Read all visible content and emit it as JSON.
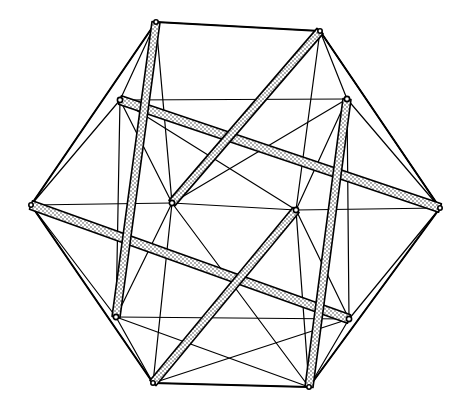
{
  "figure": {
    "canvas": {
      "width": 474,
      "height": 410,
      "background": "#ffffff"
    },
    "colors": {
      "line": "#000000",
      "background": "#ffffff",
      "strut_fill": "#ffffff",
      "stipple": "#1a1a1a"
    },
    "outer_vertices": [
      {
        "name": "top-left",
        "x": 156,
        "y": 22
      },
      {
        "name": "top-right",
        "x": 320,
        "y": 31
      },
      {
        "name": "right",
        "x": 440,
        "y": 208
      },
      {
        "name": "bottom-right",
        "x": 309,
        "y": 387
      },
      {
        "name": "bottom-left",
        "x": 153,
        "y": 383
      },
      {
        "name": "left",
        "x": 31,
        "y": 205
      }
    ],
    "inner_vertices": [
      {
        "name": "upper-left-node",
        "x": 120,
        "y": 100
      },
      {
        "name": "upper-right-node",
        "x": 347,
        "y": 99
      },
      {
        "name": "mid-left-node",
        "x": 172,
        "y": 203
      },
      {
        "name": "mid-right-node",
        "x": 296,
        "y": 210
      },
      {
        "name": "lower-left-node",
        "x": 116,
        "y": 317
      },
      {
        "name": "lower-right-node",
        "x": 349,
        "y": 319
      }
    ],
    "struts": [
      {
        "name": "strut-upper-diagonal",
        "x1": 120,
        "y1": 100,
        "x2": 440,
        "y2": 208,
        "width": 9
      },
      {
        "name": "strut-lower-diagonal",
        "x1": 31,
        "y1": 205,
        "x2": 349,
        "y2": 319,
        "width": 9
      },
      {
        "name": "strut-left-vertical",
        "x1": 156,
        "y1": 22,
        "x2": 116,
        "y2": 317,
        "width": 8
      },
      {
        "name": "strut-right-vertical",
        "x1": 347,
        "y1": 99,
        "x2": 309,
        "y2": 387,
        "width": 8
      },
      {
        "name": "strut-upper-cross",
        "x1": 320,
        "y1": 31,
        "x2": 172,
        "y2": 203,
        "width": 8
      },
      {
        "name": "strut-lower-cross",
        "x1": 296,
        "y1": 210,
        "x2": 153,
        "y2": 383,
        "width": 8
      }
    ],
    "edges": [
      [
        156,
        22,
        320,
        31
      ],
      [
        320,
        31,
        440,
        208
      ],
      [
        440,
        208,
        309,
        387
      ],
      [
        309,
        387,
        153,
        383
      ],
      [
        153,
        383,
        31,
        205
      ],
      [
        31,
        205,
        156,
        22
      ],
      [
        156,
        22,
        120,
        100
      ],
      [
        156,
        22,
        172,
        203
      ],
      [
        156,
        22,
        116,
        317
      ],
      [
        320,
        31,
        347,
        99
      ],
      [
        320,
        31,
        296,
        210
      ],
      [
        320,
        31,
        440,
        208
      ],
      [
        31,
        205,
        120,
        100
      ],
      [
        31,
        205,
        172,
        203
      ],
      [
        31,
        205,
        116,
        317
      ],
      [
        440,
        208,
        347,
        99
      ],
      [
        440,
        208,
        296,
        210
      ],
      [
        440,
        208,
        349,
        319
      ],
      [
        153,
        383,
        116,
        317
      ],
      [
        153,
        383,
        172,
        203
      ],
      [
        153,
        383,
        296,
        210
      ],
      [
        309,
        387,
        349,
        319
      ],
      [
        309,
        387,
        296,
        210
      ],
      [
        309,
        387,
        172,
        203
      ],
      [
        120,
        100,
        172,
        203
      ],
      [
        120,
        100,
        347,
        99
      ],
      [
        120,
        100,
        116,
        317
      ],
      [
        347,
        99,
        296,
        210
      ],
      [
        347,
        99,
        349,
        319
      ],
      [
        172,
        203,
        296,
        210
      ],
      [
        172,
        203,
        116,
        317
      ],
      [
        296,
        210,
        349,
        319
      ],
      [
        116,
        317,
        349,
        319
      ],
      [
        120,
        100,
        296,
        210
      ],
      [
        347,
        99,
        172,
        203
      ],
      [
        153,
        383,
        349,
        319
      ],
      [
        309,
        387,
        116,
        317
      ]
    ]
  }
}
